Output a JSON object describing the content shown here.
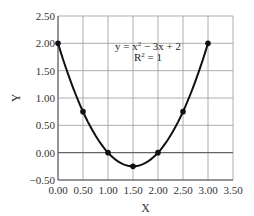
{
  "chart_data": {
    "type": "line",
    "title": "",
    "xlabel": "X",
    "ylabel": "Y",
    "xlim": [
      0,
      3.5
    ],
    "ylim": [
      -0.5,
      2.5
    ],
    "xticks": [
      "0.00",
      "0.50",
      "1.00",
      "1.50",
      "2.00",
      "2.50",
      "3.00",
      "3.50"
    ],
    "yticks": [
      "2.50",
      "2.00",
      "1.50",
      "1.00",
      "0.50",
      "0.00",
      "−0.50"
    ],
    "grid": true,
    "legend": null,
    "series": [
      {
        "name": "y = x² − 3x + 2",
        "x": [
          0,
          0.5,
          1.0,
          1.5,
          2.0,
          2.5,
          3.0
        ],
        "y": [
          2.0,
          0.75,
          0.0,
          -0.25,
          0.0,
          0.75,
          2.0
        ],
        "marker": "circle",
        "color": "#111111"
      }
    ],
    "annotations": [
      {
        "text": "y = x² − 3x + 2",
        "x": 1.75,
        "y": 1.85
      },
      {
        "text": "R² = 1",
        "x": 1.75,
        "y": 1.62
      }
    ]
  },
  "annotation": {
    "equation_prefix": "y = x",
    "equation_suffix": " − 3x + 2",
    "sup": "2",
    "r2_prefix": "R",
    "r2_suffix": " = 1"
  }
}
